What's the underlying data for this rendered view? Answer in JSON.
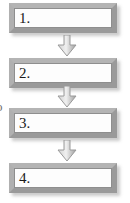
{
  "diagram": {
    "type": "flowchart",
    "orientation": "vertical",
    "background_color": "#ffffff",
    "box_border_color": "#a8a8a8",
    "box_fill_color": "#ffffff",
    "arrow_color": "#a6a6a6",
    "text_color": "#1a1a1a",
    "steps": [
      {
        "label": "1."
      },
      {
        "label": "2."
      },
      {
        "label": "3."
      },
      {
        "label": "4."
      }
    ],
    "connectors": [
      {
        "direction": "down",
        "from": "1.",
        "to": "2."
      },
      {
        "direction": "down",
        "from": "2.",
        "to": "3."
      },
      {
        "direction": "down",
        "from": "3.",
        "to": "4."
      }
    ],
    "edge_artifact": {
      "text": "o"
    }
  }
}
